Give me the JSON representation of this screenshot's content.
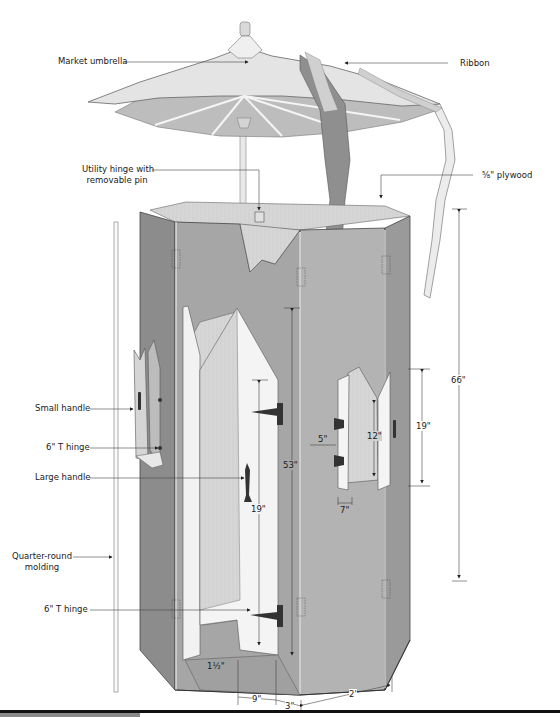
{
  "diagram": {
    "type": "exploded assembly illustration",
    "colors": {
      "panel_gray": "#a9a9a9",
      "panel_dark": "#8c8c8c",
      "panel_light": "#c4c4c4",
      "door_white": "#f4f4f4",
      "wood_grain": "#d6d6d6",
      "umbrella_top": "#e2e2e2",
      "umbrella_under": "#bdbdbd",
      "ribbon_dark": "#8f8f8f",
      "line": "#333333",
      "footer_bar": "#111111",
      "footer_tab": "#8a8a8a"
    }
  },
  "callouts": {
    "market_umbrella": "Market umbrella",
    "ribbon": "Ribbon",
    "utility_hinge_line1": "Utility hinge with",
    "utility_hinge_line2": "removable pin",
    "plywood": "⅝\" plywood",
    "small_handle": "Small handle",
    "t_hinge_upper": "6\" T hinge",
    "large_handle": "Large handle",
    "quarter_round_line1": "Quarter-round",
    "quarter_round_line2": "molding",
    "t_hinge_lower": "6\" T hinge"
  },
  "dimensions": {
    "overall_height": "66\"",
    "door_height": "53\"",
    "door_handle_height": "19\"",
    "window_height": "12\"",
    "window_sill_height": "19\"",
    "window_offset": "5\"",
    "window_width": "7\"",
    "door_sill": "1½\"",
    "door_width_offset": "9\"",
    "door_edge_offset": "3\"",
    "panel_width": "2'"
  }
}
